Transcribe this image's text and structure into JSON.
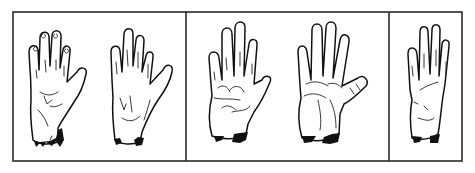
{
  "figure": {
    "panels": [
      {
        "id": "panel-1",
        "hands": [
          "hand-1",
          "hand-2"
        ]
      },
      {
        "id": "panel-2",
        "hands": [
          "hand-3",
          "hand-4"
        ]
      },
      {
        "id": "panel-3",
        "hands": [
          "hand-5"
        ]
      }
    ],
    "colors": {
      "line": "#111111",
      "background": "#ffffff",
      "frame": "#2a2a2a"
    }
  }
}
